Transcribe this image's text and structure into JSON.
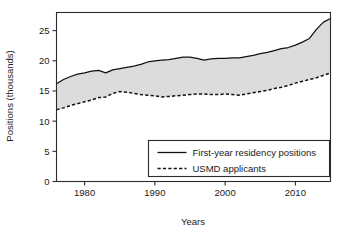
{
  "chart_data": {
    "type": "area",
    "title": "",
    "xlabel": "Years",
    "ylabel": "Positions (thousands)",
    "xlim": [
      1976,
      2015
    ],
    "ylim": [
      0,
      28
    ],
    "grid": false,
    "legend_position": "inside-bottom-right",
    "fill_between_series": true,
    "fill_color": "#dcdcdc",
    "line_color": "#111111",
    "x": [
      1976,
      1977,
      1978,
      1979,
      1980,
      1981,
      1982,
      1983,
      1984,
      1985,
      1986,
      1987,
      1988,
      1989,
      1990,
      1991,
      1992,
      1993,
      1994,
      1995,
      1996,
      1997,
      1998,
      1999,
      2000,
      2001,
      2002,
      2003,
      2004,
      2005,
      2006,
      2007,
      2008,
      2009,
      2010,
      2011,
      2012,
      2013,
      2014,
      2015
    ],
    "xticks": [
      1980,
      1990,
      2000,
      2010
    ],
    "xticklabels": [
      "1980",
      "1990",
      "2000",
      "2010"
    ],
    "yticks": [
      0,
      5,
      10,
      15,
      20,
      25
    ],
    "yticklabels": [
      "0",
      "5",
      "10",
      "15",
      "20",
      "25"
    ],
    "series": [
      {
        "name": "First-year residency positions",
        "style": "solid",
        "values": [
          16.2,
          16.9,
          17.4,
          17.8,
          18.0,
          18.3,
          18.4,
          18.0,
          18.5,
          18.7,
          18.9,
          19.1,
          19.4,
          19.8,
          20.0,
          20.1,
          20.2,
          20.4,
          20.6,
          20.6,
          20.4,
          20.1,
          20.3,
          20.4,
          20.4,
          20.5,
          20.5,
          20.7,
          20.9,
          21.2,
          21.4,
          21.7,
          22.0,
          22.2,
          22.6,
          23.1,
          23.7,
          25.2,
          26.4,
          27.0
        ]
      },
      {
        "name": "USMD applicants",
        "style": "dashed",
        "values": [
          11.9,
          12.2,
          12.6,
          12.9,
          13.2,
          13.5,
          13.9,
          14.0,
          14.6,
          14.9,
          14.8,
          14.6,
          14.4,
          14.3,
          14.2,
          14.0,
          14.1,
          14.2,
          14.3,
          14.4,
          14.5,
          14.5,
          14.4,
          14.4,
          14.5,
          14.4,
          14.3,
          14.5,
          14.7,
          14.9,
          15.1,
          15.4,
          15.6,
          15.9,
          16.3,
          16.6,
          16.9,
          17.2,
          17.6,
          18.0
        ]
      }
    ],
    "legend_entries": [
      {
        "label": "First-year residency positions",
        "style": "solid"
      },
      {
        "label": "USMD applicants",
        "style": "dashed"
      }
    ]
  }
}
